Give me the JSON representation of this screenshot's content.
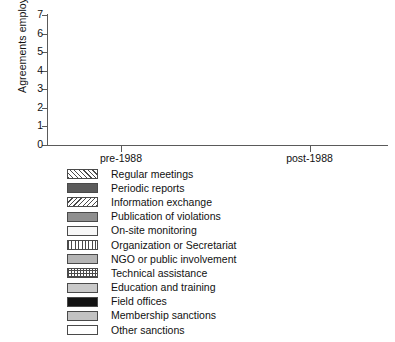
{
  "chart_data": {
    "type": "bar",
    "title": "",
    "xlabel": "",
    "ylabel": "Agreements employing",
    "ylabel_superscript": "b",
    "ylim": [
      0,
      7
    ],
    "ytick_labels": [
      "0",
      "1",
      "2",
      "3",
      "4",
      "5",
      "6",
      "7"
    ],
    "ytick_values": [
      0,
      1,
      2,
      3,
      4,
      5,
      6,
      7
    ],
    "grid": false,
    "legend_position": "below",
    "categories": [
      "pre-1988",
      "post-1988"
    ],
    "series": [
      {
        "name": "Regular meetings",
        "pattern": "diagonal-forward",
        "values": [
          1,
          6
        ]
      },
      {
        "name": "Periodic reports",
        "pattern": "dark-gray-solid",
        "values": [
          0,
          1
        ]
      },
      {
        "name": "Information exchange",
        "pattern": "diagonal-back",
        "values": [
          1,
          5
        ]
      },
      {
        "name": "Publication of violations",
        "pattern": "medium-gray-solid",
        "values": [
          0,
          3
        ]
      },
      {
        "name": "On-site monitoring",
        "pattern": "very-light-solid",
        "values": [
          1,
          0
        ]
      },
      {
        "name": "Organization or Secretariat",
        "pattern": "vertical-lines",
        "values": [
          1,
          4
        ]
      },
      {
        "name": "NGO or public involvement",
        "pattern": "light-gray-solid",
        "values": [
          0,
          3
        ]
      },
      {
        "name": "Technical assistance",
        "pattern": "checkered",
        "values": [
          1,
          3
        ]
      },
      {
        "name": "Education and training",
        "pattern": "light-gray-2",
        "values": [
          1,
          3
        ]
      },
      {
        "name": "Field offices",
        "pattern": "black-solid",
        "values": [
          0,
          1
        ]
      },
      {
        "name": "Membership sanctions",
        "pattern": "light-gray-3",
        "values": [
          0,
          1
        ]
      },
      {
        "name": "Other sanctions",
        "pattern": "white-solid",
        "values": [
          0,
          1
        ]
      }
    ]
  },
  "axes": {
    "y_title": "Agreements employing",
    "y_title_sup": "b",
    "y_ticks": [
      "0",
      "1",
      "2",
      "3",
      "4",
      "5",
      "6",
      "7"
    ],
    "x_ticks": [
      "pre-1988",
      "post-1988"
    ]
  },
  "legend": {
    "items": [
      {
        "label": "Regular meetings"
      },
      {
        "label": "Periodic reports"
      },
      {
        "label": "Information exchange"
      },
      {
        "label": "Publication of violations"
      },
      {
        "label": "On-site monitoring"
      },
      {
        "label": "Organization or Secretariat"
      },
      {
        "label": "NGO or public involvement"
      },
      {
        "label": "Technical assistance"
      },
      {
        "label": "Education and training"
      },
      {
        "label": "Field offices"
      },
      {
        "label": "Membership sanctions"
      },
      {
        "label": "Other sanctions"
      }
    ]
  }
}
